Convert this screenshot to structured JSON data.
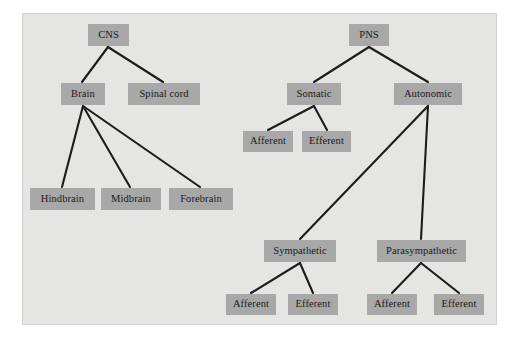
{
  "diagram": {
    "colors": {
      "page_background": "#ffffff",
      "panel_background": "#e5e5e3",
      "node_fill": "#a8a8a8",
      "node_text": "#1a1a1a",
      "edge_stroke": "#1c1c1c"
    },
    "nodes": [
      {
        "id": "cns",
        "label": "CNS",
        "x": 88,
        "y": 24,
        "w": 41,
        "h": 22
      },
      {
        "id": "pns",
        "label": "PNS",
        "x": 349,
        "y": 24,
        "w": 40,
        "h": 22
      },
      {
        "id": "brain",
        "label": "Brain",
        "x": 61,
        "y": 83,
        "w": 44,
        "h": 22
      },
      {
        "id": "spinal_cord",
        "label": "Spinal cord",
        "x": 128,
        "y": 83,
        "w": 72,
        "h": 22
      },
      {
        "id": "somatic",
        "label": "Somatic",
        "x": 287,
        "y": 83,
        "w": 54,
        "h": 22
      },
      {
        "id": "autonomic",
        "label": "Autonomic",
        "x": 394,
        "y": 83,
        "w": 68,
        "h": 22
      },
      {
        "id": "som_afferent",
        "label": "Afferent",
        "x": 243,
        "y": 131,
        "w": 50,
        "h": 21
      },
      {
        "id": "som_efferent",
        "label": "Efferent",
        "x": 302,
        "y": 131,
        "w": 49,
        "h": 21
      },
      {
        "id": "hindbrain",
        "label": "Hindbrain",
        "x": 30,
        "y": 188,
        "w": 65,
        "h": 22
      },
      {
        "id": "midbrain",
        "label": "Midbrain",
        "x": 101,
        "y": 188,
        "w": 60,
        "h": 22
      },
      {
        "id": "forebrain",
        "label": "Forebrain",
        "x": 169,
        "y": 188,
        "w": 64,
        "h": 22
      },
      {
        "id": "sympathetic",
        "label": "Sympathetic",
        "x": 264,
        "y": 240,
        "w": 72,
        "h": 22
      },
      {
        "id": "parasympathetic",
        "label": "Parasympathetic",
        "x": 377,
        "y": 240,
        "w": 89,
        "h": 22
      },
      {
        "id": "symp_afferent",
        "label": "Afferent",
        "x": 226,
        "y": 294,
        "w": 50,
        "h": 21
      },
      {
        "id": "symp_efferent",
        "label": "Efferent",
        "x": 288,
        "y": 294,
        "w": 50,
        "h": 21
      },
      {
        "id": "para_afferent",
        "label": "Afferent",
        "x": 367,
        "y": 294,
        "w": 50,
        "h": 21
      },
      {
        "id": "para_efferent",
        "label": "Efferent",
        "x": 434,
        "y": 294,
        "w": 50,
        "h": 21
      }
    ],
    "edges": [
      {
        "from": "cns",
        "to": "brain",
        "x1": 108,
        "y1": 47,
        "x2": 82,
        "y2": 82
      },
      {
        "from": "cns",
        "to": "spinal_cord",
        "x1": 108,
        "y1": 47,
        "x2": 163,
        "y2": 82
      },
      {
        "from": "brain",
        "to": "hindbrain",
        "x1": 83,
        "y1": 106,
        "x2": 62,
        "y2": 187
      },
      {
        "from": "brain",
        "to": "midbrain",
        "x1": 83,
        "y1": 106,
        "x2": 130,
        "y2": 187
      },
      {
        "from": "brain",
        "to": "forebrain",
        "x1": 83,
        "y1": 106,
        "x2": 200,
        "y2": 187
      },
      {
        "from": "pns",
        "to": "somatic",
        "x1": 369,
        "y1": 47,
        "x2": 314,
        "y2": 82
      },
      {
        "from": "pns",
        "to": "autonomic",
        "x1": 369,
        "y1": 47,
        "x2": 428,
        "y2": 82
      },
      {
        "from": "somatic",
        "to": "som_afferent",
        "x1": 314,
        "y1": 106,
        "x2": 268,
        "y2": 130
      },
      {
        "from": "somatic",
        "to": "som_efferent",
        "x1": 314,
        "y1": 106,
        "x2": 327,
        "y2": 130
      },
      {
        "from": "autonomic",
        "to": "sympathetic",
        "x1": 428,
        "y1": 106,
        "x2": 300,
        "y2": 239
      },
      {
        "from": "autonomic",
        "to": "parasympathetic",
        "x1": 428,
        "y1": 106,
        "x2": 421,
        "y2": 239
      },
      {
        "from": "sympathetic",
        "to": "symp_afferent",
        "x1": 300,
        "y1": 263,
        "x2": 251,
        "y2": 293
      },
      {
        "from": "sympathetic",
        "to": "symp_efferent",
        "x1": 300,
        "y1": 263,
        "x2": 313,
        "y2": 293
      },
      {
        "from": "parasympathetic",
        "to": "para_afferent",
        "x1": 421,
        "y1": 263,
        "x2": 392,
        "y2": 293
      },
      {
        "from": "parasympathetic",
        "to": "para_efferent",
        "x1": 421,
        "y1": 263,
        "x2": 459,
        "y2": 293
      }
    ]
  }
}
